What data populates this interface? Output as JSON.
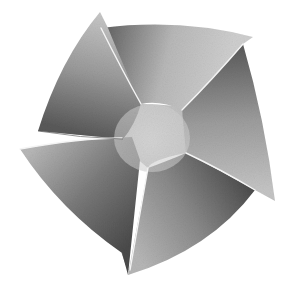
{
  "image": {
    "title": "Pinwheel graphic",
    "description": "Grayscale six-bladed curved pinwheel / fan shape on white background",
    "background": "#ffffff",
    "palette": {
      "light": "#d4d4d4",
      "mid": "#a8a8a8",
      "dark": "#5a5a5a",
      "highlight": "#f2f2f2"
    },
    "blade_count": 6
  }
}
